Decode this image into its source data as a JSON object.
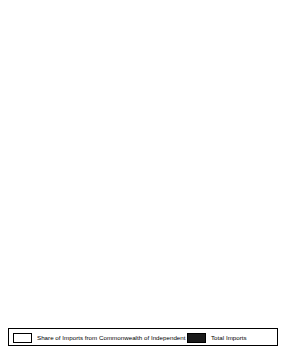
{
  "figure": {
    "axis_title": "000 $US",
    "colors": {
      "share_fill": "#ffffff",
      "total_fill": "#1a1a1a",
      "axis": "#000000",
      "background": "#ffffff"
    }
  },
  "legend": {
    "position": "bottom",
    "entries": [
      {
        "label": "Share of Imports from Commonwealth of Independent States",
        "swatch": "white"
      },
      {
        "label": "Total Imports",
        "swatch": "black"
      }
    ]
  },
  "chart_data": [
    {
      "type": "bar",
      "orientation": "horizontal",
      "stacked": true,
      "title": "",
      "xlabel": "000 $US",
      "ylabel": "",
      "xlim": [
        0,
        1350
      ],
      "xticks": [
        0,
        150,
        300,
        450,
        600,
        750,
        900,
        1050,
        1200,
        1350
      ],
      "grid": false,
      "categories": [
        "Azerbaijan",
        "Armenia",
        "Moldova",
        "Tajikistan"
      ],
      "series": [
        {
          "name": "Share of Imports from Commonwealth of Independent States",
          "values": [
            455,
            215,
            1050,
            555
          ]
        },
        {
          "name": "Total Imports",
          "values": [
            755,
            340,
            1225,
            895
          ]
        }
      ]
    },
    {
      "type": "bar",
      "orientation": "horizontal",
      "stacked": true,
      "title": "",
      "xlabel": "000 $US",
      "ylabel": "",
      "xlim": [
        0,
        4400
      ],
      "xticks": [
        0,
        400,
        800,
        1200,
        1600,
        2000,
        2400,
        2800,
        3200,
        3600,
        4000,
        4400
      ],
      "grid": false,
      "categories": [
        "Belarus'",
        "Kazakhstan",
        "Turkmenistan",
        "Uzbekistan"
      ],
      "series": [
        {
          "name": "Share of Imports from Commonwealth of Independent States",
          "values": [
            3750,
            3100,
            520,
            1250
          ]
        },
        {
          "name": "Total Imports",
          "values": [
            4200,
            3700,
            880,
            2420
          ]
        }
      ]
    },
    {
      "type": "bar",
      "orientation": "horizontal",
      "stacked": true,
      "title": "",
      "xlabel": "000 $US",
      "ylabel": "",
      "xlim": [
        0,
        40000
      ],
      "xticks": [
        0,
        5000,
        10000,
        15000,
        20000,
        25000,
        30000,
        35000,
        40000
      ],
      "grid": false,
      "categories": [
        "Russia",
        "Ukraine"
      ],
      "series": [
        {
          "name": "Share of Imports from Commonwealth of Independent States",
          "values": [
            7800,
            8100
          ]
        },
        {
          "name": "Total Imports",
          "values": [
            36200,
            9700
          ]
        }
      ]
    }
  ]
}
